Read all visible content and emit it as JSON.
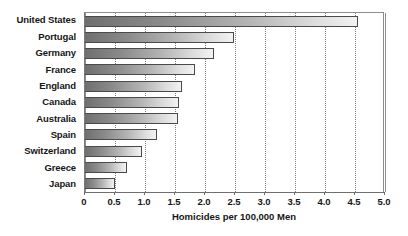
{
  "chart_data": {
    "type": "bar",
    "orientation": "horizontal",
    "title": "",
    "xlabel": "Homicides per 100,000 Men",
    "ylabel": "",
    "xlim": [
      0,
      5.0
    ],
    "xticks": [
      "0",
      "0.5",
      "1.0",
      "1.5",
      "2.0",
      "2.5",
      "3.0",
      "3.5",
      "4.0",
      "4.5",
      "5.0"
    ],
    "xtick_values": [
      0,
      0.5,
      1.0,
      1.5,
      2.0,
      2.5,
      3.0,
      3.5,
      4.0,
      4.5,
      5.0
    ],
    "grid": "vertical-dotted",
    "legend": "none",
    "categories": [
      "United States",
      "Portugal",
      "Germany",
      "France",
      "England",
      "Canada",
      "Australia",
      "Spain",
      "Switzerland",
      "Greece",
      "Japan"
    ],
    "values": [
      4.55,
      2.48,
      2.15,
      1.83,
      1.61,
      1.57,
      1.55,
      1.2,
      0.95,
      0.7,
      0.5
    ],
    "bar_style": {
      "fill": "linear-gradient dark-gray to light-gray, left to right",
      "border": "#4a4a4a"
    }
  },
  "colors": {
    "text": "#161616",
    "axis": "#6f6f6f",
    "grid": "#7f7f7f",
    "bar_dark": "#6f6f6f",
    "bar_light": "#f2f2f2",
    "background": "#ffffff"
  }
}
